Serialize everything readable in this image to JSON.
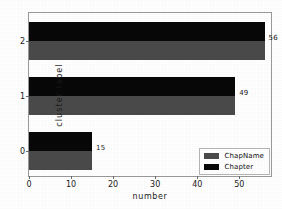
{
  "chart_data": {
    "type": "bar",
    "orientation": "horizontal",
    "title": "",
    "xlabel": "number",
    "ylabel": "cluster label",
    "categories": [
      "0",
      "1",
      "2"
    ],
    "series": [
      {
        "name": "ChapName",
        "color": "#4a4a4a",
        "values": [
          15,
          49,
          56
        ]
      },
      {
        "name": "Chapter",
        "color": "#080808",
        "values": [
          15,
          49,
          56
        ]
      }
    ],
    "value_labels": [
      "15",
      "49",
      "56"
    ],
    "xlim": [
      0,
      58
    ],
    "xticks": [
      0,
      10,
      20,
      30,
      40,
      50
    ],
    "xtick_labels": [
      "0",
      "10",
      "20",
      "30",
      "40",
      "50"
    ],
    "ytick_labels": [
      "0",
      "1",
      "2"
    ],
    "grid": false,
    "legend_position": "lower right"
  },
  "legend": {
    "entries": [
      {
        "label": "ChapName",
        "color": "#4a4a4a"
      },
      {
        "label": "Chapter",
        "color": "#080808"
      }
    ]
  }
}
